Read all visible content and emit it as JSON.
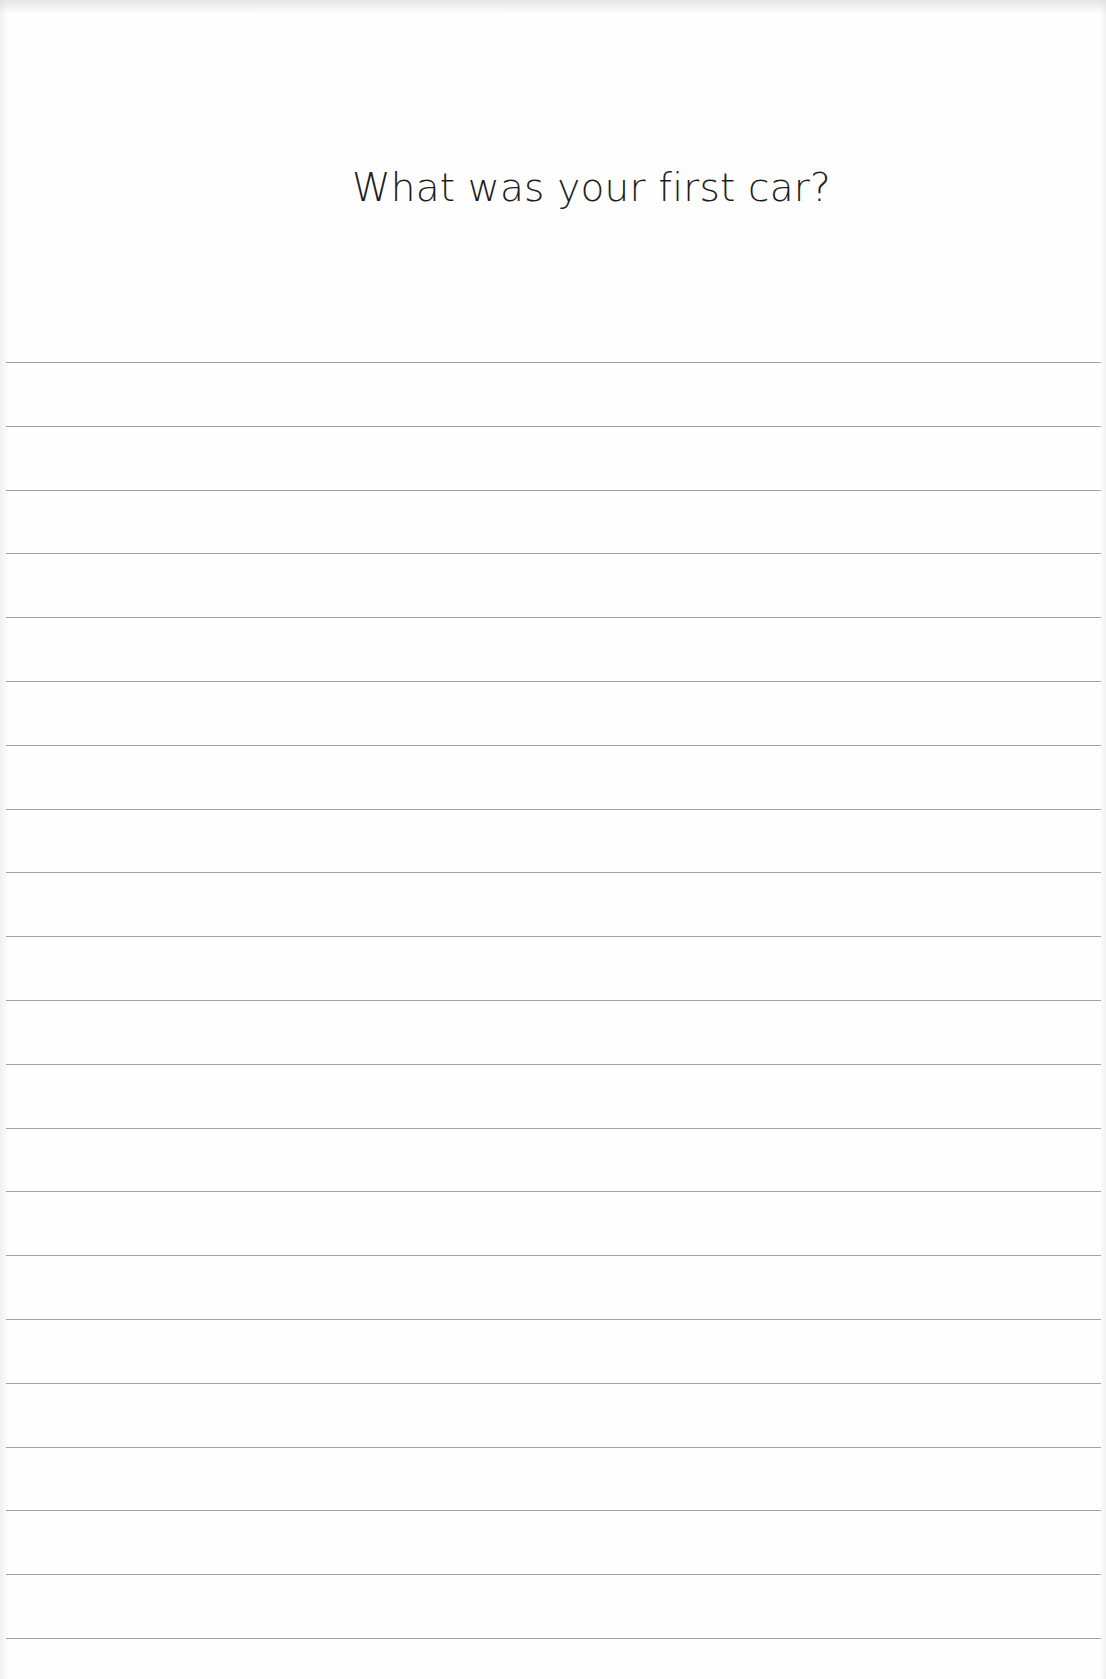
{
  "page": {
    "prompt": "What was your first car?",
    "line_count": 21,
    "first_line_y": 362,
    "line_spacing": 63.8,
    "line_color": "#a3a3a3",
    "background": "#fefefe",
    "text_color": "#1e1e1e"
  }
}
